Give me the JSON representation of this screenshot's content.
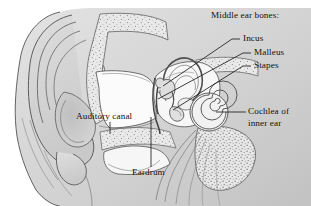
{
  "figure": {
    "kind": "anatomical-illustration",
    "style": "grayscale pen-and-ink line drawing with stippled bone",
    "background_color": "#ffffff",
    "line_color": "#3a3a3a",
    "tissue_fill": "#d7d7d7",
    "bone_fill": "#e6e6e6",
    "cavity_fill": "#fbfbfb",
    "text_color": "#14110f"
  },
  "labels": {
    "group_heading": "Middle ear bones:",
    "incus": "Incus",
    "malleus": "Malleus",
    "stapes": "Stapes",
    "auditory_canal": "Auditory canal",
    "cochlea_line1": "Cochlea of",
    "cochlea_line2": "inner ear",
    "eardrum": "Eardrum"
  },
  "leader_lines": [
    {
      "name": "incus",
      "from_label": [
        232,
        39
      ],
      "to_part": [
        163,
        86
      ]
    },
    {
      "name": "malleus",
      "from_label": [
        243,
        53
      ],
      "to_part": [
        158,
        98
      ]
    },
    {
      "name": "stapes",
      "from_label": [
        243,
        66
      ],
      "to_part": [
        172,
        82
      ]
    },
    {
      "name": "auditory-canal",
      "from_label": [
        110,
        122
      ],
      "to_part": [
        110,
        133
      ]
    },
    {
      "name": "cochlea",
      "from_label": [
        243,
        112
      ],
      "to_part": [
        216,
        112
      ]
    },
    {
      "name": "eardrum",
      "from_label": [
        151,
        167
      ],
      "to_part": [
        151,
        117
      ]
    }
  ],
  "parts": [
    "pinna (outer ear)",
    "auditory canal",
    "eardrum (tympanic membrane)",
    "malleus",
    "incus",
    "stapes",
    "semicircular canals",
    "cochlea",
    "auditory nerve",
    "temporal bone"
  ]
}
